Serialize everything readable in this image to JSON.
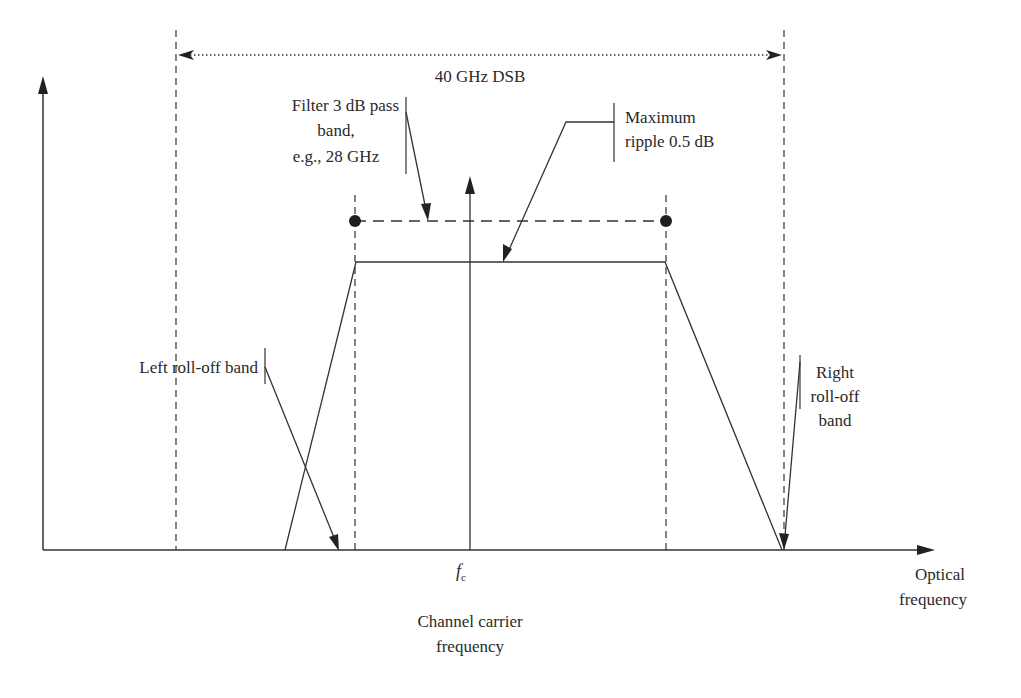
{
  "figure": {
    "type": "filter-transfer-function-diagram",
    "colors": {
      "line": "#333333",
      "text": "#2a2a2a",
      "background": "#ffffff"
    },
    "labels": {
      "dsb_span": "40 GHz DSB",
      "passband_line1": "Filter 3 dB pass",
      "passband_line2": "band,",
      "passband_line3": "e.g., 28 GHz",
      "ripple_line1": "Maximum",
      "ripple_line2": "ripple 0.5 dB",
      "left_rolloff": "Left roll-off band",
      "right_rolloff_line1": "Right",
      "right_rolloff_line2": "roll-off",
      "right_rolloff_line3": "band",
      "carrier_symbol": "f",
      "carrier_subscript": "c",
      "carrier_line1": "Channel carrier",
      "carrier_line2": "frequency",
      "x_axis_line1": "Optical",
      "x_axis_line2": "frequency"
    },
    "values": {
      "dsb_bandwidth_ghz": 40,
      "passband_3db_example_ghz": 28,
      "max_ripple_db": 0.5
    }
  }
}
